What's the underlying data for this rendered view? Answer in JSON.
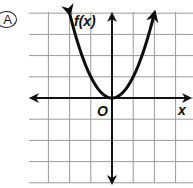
{
  "option_label": "A",
  "chart_data": {
    "type": "line",
    "title": "",
    "function": "f(x) = x^2",
    "ylabel": "f(x)",
    "xlabel": "x",
    "origin_label": "O",
    "xlim": [
      -4,
      4
    ],
    "ylim": [
      -4,
      4
    ],
    "grid": true,
    "grid_step": 1,
    "axis_ticks_labeled": false,
    "series": [
      {
        "name": "f(x)",
        "x": [
          -2,
          -1.5,
          -1,
          -0.5,
          0,
          0.5,
          1,
          1.5,
          2
        ],
        "y": [
          4,
          2.25,
          1,
          0.25,
          0,
          0.25,
          1,
          2.25,
          4
        ],
        "arrows_at_ends": true
      }
    ],
    "vertex": [
      0,
      0
    ]
  },
  "colors": {
    "grid": "#9a9a9a",
    "axis": "#111111",
    "curve": "#0d0d0d",
    "background": "#ffffff"
  }
}
